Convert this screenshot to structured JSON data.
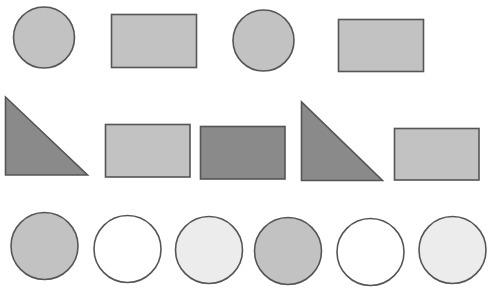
{
  "colors": {
    "stroke": "#555555",
    "medium_gray": "#c2c2c2",
    "dark_gray": "#8a8a8a",
    "white": "#ffffff",
    "very_light_gray": "#ececec",
    "background": "#ffffff"
  },
  "rows": [
    {
      "shapes": [
        {
          "type": "circle",
          "fill": "medium_gray"
        },
        {
          "type": "rectangle",
          "fill": "medium_gray"
        },
        {
          "type": "circle",
          "fill": "medium_gray"
        },
        {
          "type": "rectangle",
          "fill": "medium_gray"
        }
      ]
    },
    {
      "shapes": [
        {
          "type": "right-triangle",
          "fill": "dark_gray"
        },
        {
          "type": "rectangle",
          "fill": "medium_gray"
        },
        {
          "type": "rectangle",
          "fill": "dark_gray"
        },
        {
          "type": "right-triangle",
          "fill": "dark_gray"
        },
        {
          "type": "rectangle",
          "fill": "medium_gray"
        }
      ]
    },
    {
      "shapes": [
        {
          "type": "circle",
          "fill": "medium_gray"
        },
        {
          "type": "circle",
          "fill": "white"
        },
        {
          "type": "circle",
          "fill": "very_light_gray"
        },
        {
          "type": "circle",
          "fill": "medium_gray"
        },
        {
          "type": "circle",
          "fill": "white"
        },
        {
          "type": "circle",
          "fill": "very_light_gray"
        }
      ]
    }
  ]
}
